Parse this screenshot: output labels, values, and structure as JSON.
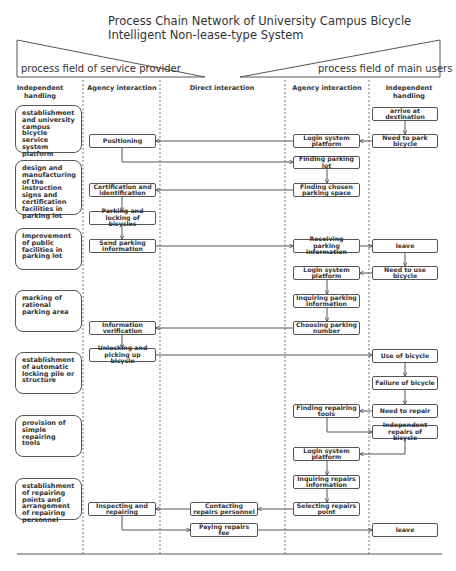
{
  "title": {
    "line1": "Process Chain Network of University Campus Bicycle",
    "line2": "Intelligent Non-lease-type System"
  },
  "fields": {
    "left": "process field of service provider",
    "right": "process field of main users"
  },
  "columns": [
    {
      "id": "sp_independent",
      "label": "Independent handling",
      "x_center": 40
    },
    {
      "id": "sp_agency",
      "label": "Agency interaction",
      "x_center": 122
    },
    {
      "id": "direct",
      "label": "Direct interaction",
      "x_center": 222
    },
    {
      "id": "mu_agency",
      "label": "Agency interaction",
      "x_center": 327
    },
    {
      "id": "mu_independent",
      "label": "Independent handling",
      "x_center": 409
    }
  ],
  "dividers_x": [
    83,
    160,
    285,
    369
  ],
  "side_boxes": [
    {
      "id": "s1",
      "text": "establishment and university campus bicycle service system platform",
      "x": 15,
      "y": 105,
      "w": 67,
      "h": 48
    },
    {
      "id": "s2",
      "text": "design and manufacturing of the instruction signs and certification facilities in parking lot",
      "x": 15,
      "y": 160,
      "w": 67,
      "h": 55
    },
    {
      "id": "s3",
      "text": "Improvement of public facilities in parking lot",
      "x": 15,
      "y": 228,
      "w": 67,
      "h": 42
    },
    {
      "id": "s4",
      "text": "marking of rational parking area",
      "x": 15,
      "y": 290,
      "w": 67,
      "h": 42
    },
    {
      "id": "s5",
      "text": "establishment of automatic locking pile or structure",
      "x": 15,
      "y": 352,
      "w": 67,
      "h": 42
    },
    {
      "id": "s6",
      "text": "provision of simple repairing tools",
      "x": 15,
      "y": 415,
      "w": 67,
      "h": 42
    },
    {
      "id": "s7",
      "text": "establishment of repairing points and arrangement of repairing personnel",
      "x": 15,
      "y": 478,
      "w": 67,
      "h": 42
    }
  ],
  "nodes": [
    {
      "id": "n_arrive",
      "text": "arrive at destination",
      "x": 372,
      "y": 107,
      "w": 66,
      "h": 14
    },
    {
      "id": "n_need_park",
      "text": "Need to park bicycle",
      "x": 372,
      "y": 134,
      "w": 66,
      "h": 14
    },
    {
      "id": "n_login1",
      "text": "Login system platform",
      "x": 293,
      "y": 134,
      "w": 67,
      "h": 14
    },
    {
      "id": "n_positioning",
      "text": "Positioning",
      "x": 89,
      "y": 134,
      "w": 67,
      "h": 14
    },
    {
      "id": "n_find_lot",
      "text": "Finding parking lot",
      "x": 293,
      "y": 156,
      "w": 67,
      "h": 13
    },
    {
      "id": "n_find_space",
      "text": "Finding chosen parking space",
      "x": 293,
      "y": 183,
      "w": 67,
      "h": 14
    },
    {
      "id": "n_cert",
      "text": "Certification and identification",
      "x": 89,
      "y": 183,
      "w": 67,
      "h": 14
    },
    {
      "id": "n_park_lock",
      "text": "Parking and locking of bicycles",
      "x": 89,
      "y": 211,
      "w": 67,
      "h": 14
    },
    {
      "id": "n_send_info",
      "text": "Send parking information",
      "x": 89,
      "y": 239,
      "w": 67,
      "h": 14
    },
    {
      "id": "n_recv_info",
      "text": "Receiving parking information",
      "x": 293,
      "y": 239,
      "w": 67,
      "h": 14
    },
    {
      "id": "n_leave1",
      "text": "leave",
      "x": 372,
      "y": 239,
      "w": 66,
      "h": 14
    },
    {
      "id": "n_need_use",
      "text": "Need to use bicycle",
      "x": 372,
      "y": 266,
      "w": 66,
      "h": 14
    },
    {
      "id": "n_login2",
      "text": "Login system platform",
      "x": 293,
      "y": 266,
      "w": 67,
      "h": 14
    },
    {
      "id": "n_inq_park",
      "text": "Inquiring parking information",
      "x": 293,
      "y": 294,
      "w": 67,
      "h": 14
    },
    {
      "id": "n_choose_num",
      "text": "Choosing parking number",
      "x": 293,
      "y": 321,
      "w": 67,
      "h": 14
    },
    {
      "id": "n_info_verif",
      "text": "Information verification",
      "x": 89,
      "y": 321,
      "w": 67,
      "h": 14
    },
    {
      "id": "n_unlock",
      "text": "Unlocking and picking up bicycle",
      "x": 89,
      "y": 348,
      "w": 67,
      "h": 14
    },
    {
      "id": "n_use",
      "text": "Use of bicycle",
      "x": 372,
      "y": 349,
      "w": 66,
      "h": 14
    },
    {
      "id": "n_failure",
      "text": "Failure of bicycle",
      "x": 372,
      "y": 376,
      "w": 66,
      "h": 14
    },
    {
      "id": "n_need_repair",
      "text": "Need to repair",
      "x": 372,
      "y": 404,
      "w": 66,
      "h": 14
    },
    {
      "id": "n_find_tools",
      "text": "Finding repairing tools",
      "x": 293,
      "y": 404,
      "w": 67,
      "h": 14
    },
    {
      "id": "n_indep_repair",
      "text": "Independent repairs of bicycle",
      "x": 372,
      "y": 425,
      "w": 66,
      "h": 14
    },
    {
      "id": "n_login3",
      "text": "Login system platform",
      "x": 293,
      "y": 447,
      "w": 67,
      "h": 14
    },
    {
      "id": "n_inq_repair",
      "text": "Inquiring repairs information",
      "x": 293,
      "y": 475,
      "w": 67,
      "h": 14
    },
    {
      "id": "n_select_repair",
      "text": "Selecting repairs point",
      "x": 293,
      "y": 502,
      "w": 67,
      "h": 14
    },
    {
      "id": "n_contact",
      "text": "Contacting repairs personnel",
      "x": 190,
      "y": 502,
      "w": 68,
      "h": 14
    },
    {
      "id": "n_inspect",
      "text": "Inspecting and repairing",
      "x": 88,
      "y": 502,
      "w": 68,
      "h": 14
    },
    {
      "id": "n_pay",
      "text": "Paying repairs fee",
      "x": 190,
      "y": 523,
      "w": 68,
      "h": 14
    },
    {
      "id": "n_leave2",
      "text": "leave",
      "x": 372,
      "y": 523,
      "w": 66,
      "h": 14
    }
  ],
  "edges": [
    {
      "points": [
        [
          405,
          121
        ],
        [
          405,
          134
        ]
      ]
    },
    {
      "points": [
        [
          372,
          141
        ],
        [
          360,
          141
        ]
      ]
    },
    {
      "points": [
        [
          293,
          141
        ],
        [
          156,
          141
        ]
      ]
    },
    {
      "points": [
        [
          122,
          148
        ],
        [
          122,
          162
        ],
        [
          293,
          162
        ]
      ]
    },
    {
      "points": [
        [
          327,
          169
        ],
        [
          327,
          183
        ]
      ]
    },
    {
      "points": [
        [
          293,
          190
        ],
        [
          156,
          190
        ]
      ]
    },
    {
      "points": [
        [
          122,
          197
        ],
        [
          122,
          211
        ]
      ]
    },
    {
      "points": [
        [
          122,
          225
        ],
        [
          122,
          239
        ]
      ]
    },
    {
      "points": [
        [
          156,
          246
        ],
        [
          293,
          246
        ]
      ]
    },
    {
      "points": [
        [
          360,
          246
        ],
        [
          372,
          246
        ]
      ]
    },
    {
      "points": [
        [
          405,
          253
        ],
        [
          405,
          266
        ]
      ]
    },
    {
      "points": [
        [
          372,
          273
        ],
        [
          360,
          273
        ]
      ]
    },
    {
      "points": [
        [
          327,
          280
        ],
        [
          327,
          294
        ]
      ]
    },
    {
      "points": [
        [
          327,
          308
        ],
        [
          327,
          321
        ]
      ]
    },
    {
      "points": [
        [
          293,
          328
        ],
        [
          156,
          328
        ]
      ]
    },
    {
      "points": [
        [
          122,
          335
        ],
        [
          122,
          348
        ]
      ]
    },
    {
      "points": [
        [
          156,
          355
        ],
        [
          372,
          355
        ]
      ]
    },
    {
      "points": [
        [
          405,
          363
        ],
        [
          405,
          376
        ]
      ]
    },
    {
      "points": [
        [
          405,
          390
        ],
        [
          405,
          404
        ]
      ]
    },
    {
      "points": [
        [
          372,
          411
        ],
        [
          360,
          411
        ]
      ]
    },
    {
      "points": [
        [
          327,
          418
        ],
        [
          327,
          432
        ],
        [
          372,
          432
        ]
      ]
    },
    {
      "points": [
        [
          405,
          439
        ],
        [
          405,
          454
        ],
        [
          360,
          454
        ]
      ]
    },
    {
      "points": [
        [
          327,
          461
        ],
        [
          327,
          475
        ]
      ]
    },
    {
      "points": [
        [
          327,
          489
        ],
        [
          327,
          502
        ]
      ]
    },
    {
      "points": [
        [
          293,
          509
        ],
        [
          258,
          509
        ]
      ]
    },
    {
      "points": [
        [
          190,
          509
        ],
        [
          156,
          509
        ]
      ]
    },
    {
      "points": [
        [
          122,
          516
        ],
        [
          122,
          530
        ],
        [
          190,
          530
        ]
      ]
    },
    {
      "points": [
        [
          258,
          530
        ],
        [
          372,
          530
        ]
      ]
    }
  ],
  "colors": {
    "line": "#444444",
    "box_border": "#555555",
    "text": "#333333",
    "background": "#ffffff"
  }
}
